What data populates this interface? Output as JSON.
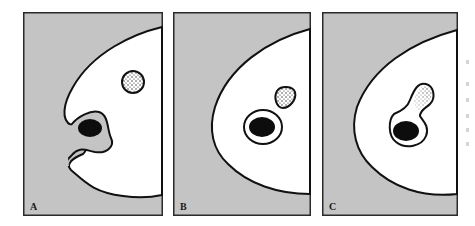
{
  "figure": {
    "type": "three-panel schematic diagram",
    "colors": {
      "background": "#ffffff",
      "panel_fill": "#c4c4c4",
      "shape_fill": "#ffffff",
      "outline": "#111111",
      "dark_body": "#0d0d0d"
    },
    "panels": [
      {
        "label": "A",
        "description": "Large white body with a notch on the left; a dark oval enclosed in a grey pocket opens to the outside; a stippled round body sits in the upper right."
      },
      {
        "label": "B",
        "description": "Large white body with smooth convex left edge; a dark oval surrounded by a white ring sits inside; a stippled rounded body lies above right."
      },
      {
        "label": "C",
        "description": "Large white body with smooth convex left edge; a dark oval inside a white ring that merges with a stippled lobe extending up-right (flask shape)."
      }
    ]
  }
}
